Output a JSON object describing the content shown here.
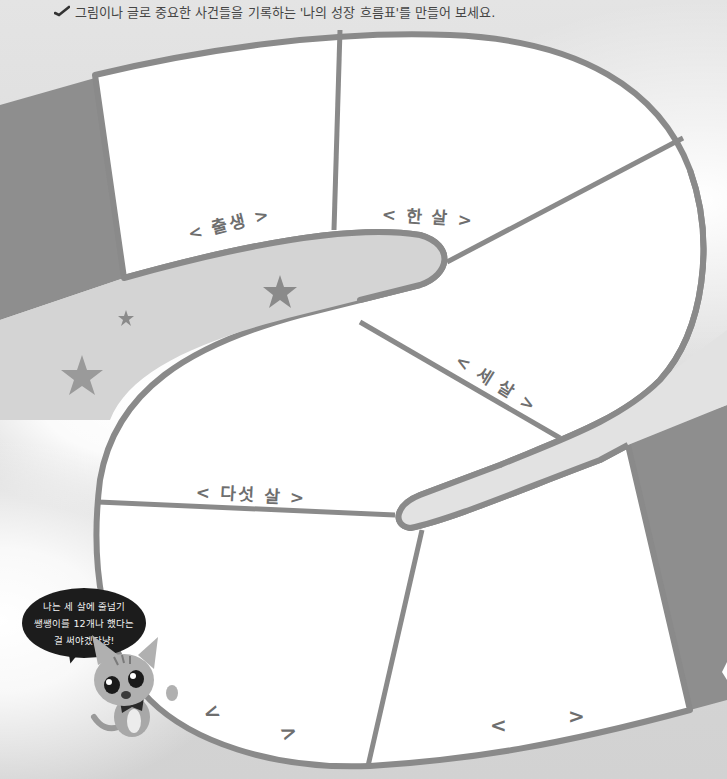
{
  "instruction": {
    "icon": "check-icon",
    "text": "그림이나 글로 중요한 사건들을 기록하는 '나의 성장 흐름표'를 만들어 보세요."
  },
  "timeline": {
    "stages": [
      {
        "id": "birth",
        "label": "< 출생 >"
      },
      {
        "id": "age-one",
        "label": "< 한 살 >"
      },
      {
        "id": "age-three",
        "label": "< 세 살 >"
      },
      {
        "id": "age-five",
        "label": "< 다섯 살 >"
      },
      {
        "id": "blank-1",
        "open": "<",
        "close": ">"
      },
      {
        "id": "blank-2",
        "open": "<",
        "close": ">"
      }
    ]
  },
  "mascot": {
    "speech_lines": [
      "나는 세 살에 줄넘기",
      "쌩쌩이를 12개나 했다는",
      "걸 써야겠다냥!"
    ]
  },
  "colors": {
    "path_outline": "#8a8a8a",
    "panel_fill": "#ffffff",
    "ribbon_dark": "#8e8e8e",
    "star": "#8f8f8f",
    "label_text": "#6e6e6e"
  }
}
